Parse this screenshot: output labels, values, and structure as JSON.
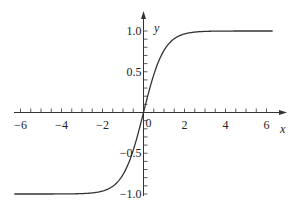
{
  "chart_data": {
    "type": "line",
    "title": "",
    "xlabel": "x",
    "ylabel": "y",
    "function": "tanh(x)",
    "xlim": [
      -6.3,
      6.3
    ],
    "ylim": [
      -1.0,
      1.0
    ],
    "grid": false,
    "legend": null,
    "x_ticks": [
      -6,
      -4,
      -2,
      0,
      2,
      4,
      6
    ],
    "x_tick_labels": [
      "-6",
      "-4",
      "-2",
      "0",
      "2",
      "4",
      "6"
    ],
    "x_minor_tick_step": 0.5,
    "y_ticks": [
      -1.0,
      -0.5,
      0.5,
      1.0
    ],
    "y_tick_labels": [
      "-1.0",
      "-0.5",
      "0.5",
      "1.0"
    ],
    "y_minor_tick_step": 0.1,
    "origin_label": "0",
    "series": [
      {
        "name": "y = tanh(x)",
        "x": [
          -6,
          -5,
          -4,
          -3,
          -2.5,
          -2,
          -1.5,
          -1,
          -0.5,
          0,
          0.5,
          1,
          1.5,
          2,
          2.5,
          3,
          4,
          5,
          6
        ],
        "values": [
          -1.0,
          -1.0,
          -0.999,
          -0.995,
          -0.987,
          -0.964,
          -0.905,
          -0.762,
          -0.462,
          0.0,
          0.462,
          0.762,
          0.905,
          0.964,
          0.987,
          0.995,
          0.999,
          1.0,
          1.0
        ],
        "color": "#333333"
      }
    ]
  }
}
